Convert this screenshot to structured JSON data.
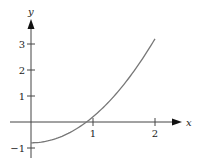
{
  "chart_data": {
    "type": "line",
    "title": "",
    "xlabel": "x",
    "ylabel": "y",
    "xlim": [
      -0.5,
      2.3
    ],
    "ylim": [
      -1.2,
      3.7
    ],
    "x_ticks": [
      {
        "value": 1,
        "label": "1"
      },
      {
        "value": 2,
        "label": "2"
      }
    ],
    "y_ticks": [
      {
        "value": -1,
        "label": "−1"
      },
      {
        "value": 1,
        "label": "1"
      },
      {
        "value": 2,
        "label": "2"
      },
      {
        "value": 3,
        "label": "3"
      }
    ],
    "grid": false,
    "legend": null,
    "series": [
      {
        "name": "curve",
        "color": "#777777",
        "x": [
          0,
          0.25,
          0.5,
          0.75,
          0.894,
          1.0,
          1.25,
          1.5,
          1.75,
          2.0
        ],
        "y": [
          -0.8,
          -0.74,
          -0.55,
          -0.24,
          0.0,
          0.2,
          0.76,
          1.45,
          2.26,
          3.2
        ]
      }
    ]
  },
  "colors": {
    "axis": "#444444",
    "curve": "#777777",
    "background": "#ffffff"
  }
}
